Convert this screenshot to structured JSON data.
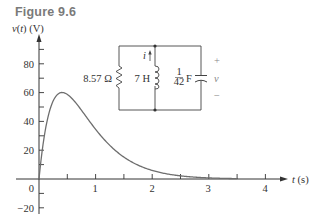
{
  "figure": {
    "title": "Figure 9.6"
  },
  "chart_data": {
    "type": "line",
    "title": "Figure 9.6",
    "xlabel": "t (s)",
    "ylabel": "v(t) (V)",
    "xlim": [
      0,
      4.4
    ],
    "ylim": [
      -25,
      95
    ],
    "x_ticks": [
      0,
      0.5,
      1,
      1.5,
      2,
      2.5,
      3,
      3.5,
      4
    ],
    "x_tick_labels": [
      "0",
      "1",
      "2",
      "3",
      "4"
    ],
    "y_ticks": [
      -20,
      -10,
      0,
      10,
      20,
      30,
      40,
      50,
      60,
      70,
      80,
      90
    ],
    "y_tick_labels": [
      "-20",
      "20",
      "40",
      "60",
      "80"
    ],
    "grid": false,
    "legend": null,
    "series": [
      {
        "name": "v(t)",
        "color": "#6e6e6e",
        "x": [
          0,
          0.05,
          0.1,
          0.15,
          0.2,
          0.3,
          0.4,
          0.5,
          0.6,
          0.8,
          1.0,
          1.2,
          1.5,
          2.0,
          2.5,
          3.0,
          3.5
        ],
        "values": [
          0,
          17.7,
          31.3,
          41.5,
          49.0,
          57.6,
          60.0,
          58.8,
          55.2,
          45.1,
          34.5,
          25.3,
          15.3,
          6.0,
          2.2,
          0.8,
          0.3
        ]
      }
    ],
    "annotations": {
      "circuit": {
        "resistor": "8.57 Ω",
        "inductor": "7 H",
        "capacitor_num": "1",
        "capacitor_den": "42",
        "capacitor_unit": "F",
        "current_label": "i",
        "voltage_label": "v",
        "plus": "+",
        "minus": "−"
      }
    }
  },
  "axis": {
    "ylabel": "v(t) (V)",
    "xlabel": "t (s)",
    "y_labels": [
      "80",
      "60",
      "40",
      "20",
      "0",
      "−20"
    ],
    "x_labels": [
      "1",
      "2",
      "3",
      "4"
    ]
  }
}
